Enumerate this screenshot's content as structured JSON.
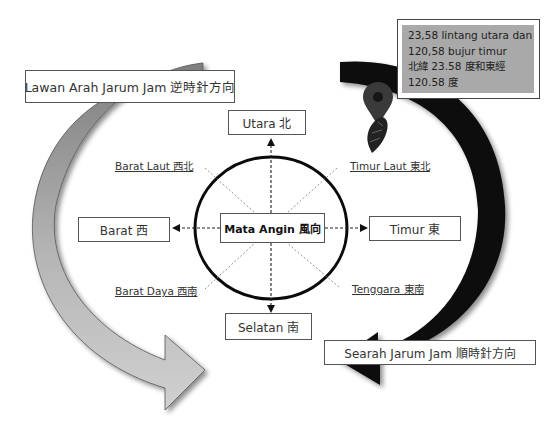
{
  "diagram": {
    "center": {
      "label": "Mata Angin 風向"
    },
    "cardinal": {
      "north": "Utara 北",
      "south": "Selatan 南",
      "west": "Barat 西",
      "east": "Timur 東"
    },
    "intercardinal": {
      "northwest": "Barat Laut 西北",
      "northeast": "Timur Laut 東北",
      "southwest": "Barat Daya 西南",
      "southeast": "Tenggara 東南"
    },
    "rotation": {
      "counterclockwise": "Lawan Arah Jarum Jam 逆時針方向",
      "clockwise": "Searah Jarum Jam 順時針方向"
    },
    "location": {
      "lines": [
        "23,58 lintang utara dan",
        "120,58 bujur timur",
        "北緯 23.58 度和東經",
        "120.58 度"
      ],
      "icons": [
        "map-pin-icon",
        "taiwan-map-icon"
      ]
    },
    "colors": {
      "left_arrow": "#a8a8a8",
      "right_arrow": "#0a0a0a",
      "coord_box_bg": "#a9a9a9",
      "pin": "#3a3a3a"
    }
  }
}
